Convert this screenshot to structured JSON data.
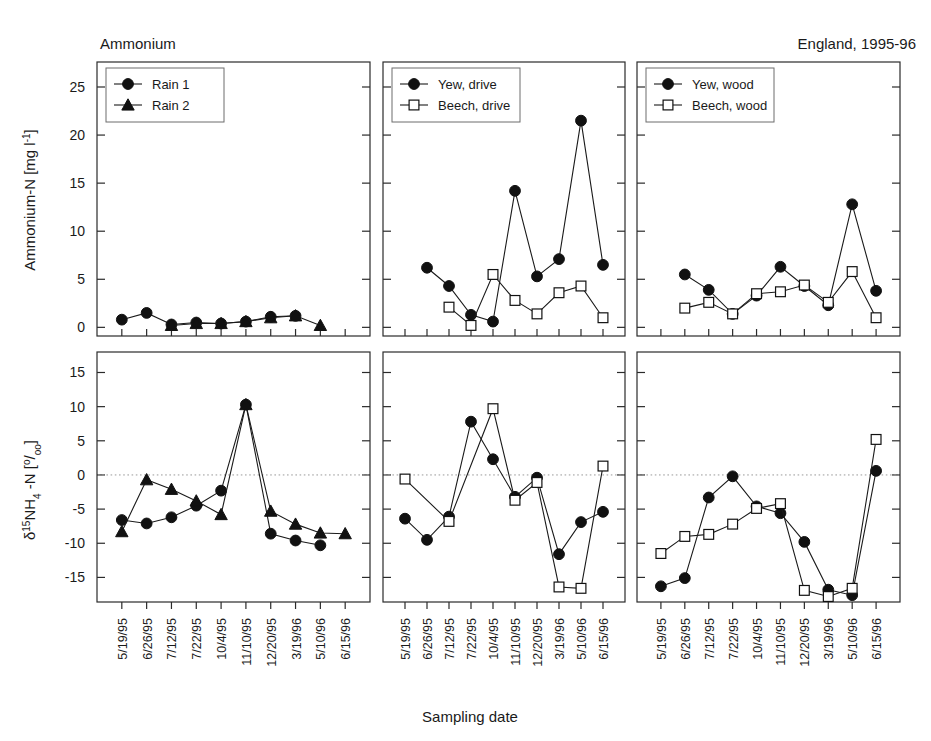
{
  "figure": {
    "title_left": "Ammonium",
    "title_right": "England, 1995-96",
    "xlabel": "Sampling date",
    "ylabel_top": "Ammonium-N [mg l-1]",
    "ylabel_bottom": "d 15NH4-N [o/oo]"
  },
  "axes": {
    "top_ticks": [
      "0",
      "5",
      "10",
      "15",
      "20",
      "25"
    ],
    "bottom_ticks": [
      "-15",
      "-10",
      "-5",
      "0",
      "5",
      "10",
      "15"
    ],
    "top_range": [
      0,
      27
    ],
    "bottom_range": [
      -18,
      17
    ],
    "x_categories": [
      "5/19/95",
      "6/26/95",
      "7/12/95",
      "7/22/95",
      "10/4/95",
      "11/10/95",
      "12/20/95",
      "3/19/96",
      "5/10/96",
      "6/15/96"
    ]
  },
  "legends": {
    "panel1": [
      {
        "label": "Rain 1",
        "marker": "filled-circle"
      },
      {
        "label": "Rain 2",
        "marker": "filled-triangle"
      }
    ],
    "panel2": [
      {
        "label": "Yew, drive",
        "marker": "filled-circle"
      },
      {
        "label": "Beech, drive",
        "marker": "open-square"
      }
    ],
    "panel3": [
      {
        "label": "Yew, wood",
        "marker": "filled-circle"
      },
      {
        "label": "Beech, wood",
        "marker": "open-square"
      }
    ]
  },
  "chart_data": [
    {
      "type": "line",
      "panel": "top-left",
      "title": "Ammonium",
      "xlabel": "Sampling date",
      "ylabel": "Ammonium-N [mg l-1]",
      "ylim": [
        0,
        27
      ],
      "grid": false,
      "legend_position": "top-left",
      "categories": [
        "5/19/95",
        "6/26/95",
        "7/12/95",
        "7/22/95",
        "10/4/95",
        "11/10/95",
        "12/20/95",
        "3/19/96",
        "5/10/96",
        "6/15/96"
      ],
      "series": [
        {
          "name": "Rain 1",
          "marker": "filled-circle",
          "values": [
            0.8,
            1.5,
            0.3,
            0.5,
            0.4,
            0.6,
            1.1,
            1.2,
            null,
            null
          ]
        },
        {
          "name": "Rain 2",
          "marker": "filled-triangle",
          "values": [
            null,
            null,
            0.2,
            0.4,
            0.4,
            0.6,
            1.0,
            1.2,
            0.2,
            null
          ]
        }
      ]
    },
    {
      "type": "line",
      "panel": "top-middle",
      "ylabel": "Ammonium-N [mg l-1]",
      "ylim": [
        0,
        27
      ],
      "grid": false,
      "legend_position": "top-left",
      "categories": [
        "5/19/95",
        "6/26/95",
        "7/12/95",
        "7/22/95",
        "10/4/95",
        "11/10/95",
        "12/20/95",
        "3/19/96",
        "5/10/96",
        "6/15/96"
      ],
      "series": [
        {
          "name": "Yew, drive",
          "marker": "filled-circle",
          "values": [
            null,
            6.2,
            4.3,
            1.3,
            0.6,
            14.2,
            5.3,
            7.1,
            21.5,
            6.5
          ]
        },
        {
          "name": "Beech, drive",
          "marker": "open-square",
          "values": [
            null,
            null,
            2.1,
            0.2,
            5.5,
            2.8,
            1.4,
            3.6,
            4.3,
            1.0
          ]
        }
      ]
    },
    {
      "type": "line",
      "panel": "top-right",
      "ylabel": "Ammonium-N [mg l-1]",
      "ylim": [
        0,
        27
      ],
      "grid": false,
      "legend_position": "top-left",
      "categories": [
        "5/19/95",
        "6/26/95",
        "7/12/95",
        "7/22/95",
        "10/4/95",
        "11/10/95",
        "12/20/95",
        "3/19/96",
        "5/10/96",
        "6/15/96"
      ],
      "series": [
        {
          "name": "Yew, wood",
          "marker": "filled-circle",
          "values": [
            null,
            5.5,
            3.9,
            1.4,
            3.3,
            6.3,
            4.3,
            2.3,
            12.8,
            3.8
          ]
        },
        {
          "name": "Beech, wood",
          "marker": "open-square",
          "values": [
            null,
            2.0,
            2.6,
            1.4,
            3.5,
            3.7,
            4.4,
            2.6,
            5.8,
            1.0
          ]
        }
      ]
    },
    {
      "type": "line",
      "panel": "bottom-left",
      "xlabel": "Sampling date",
      "ylabel": "d 15NH4-N [o/oo]",
      "ylim": [
        -18,
        17
      ],
      "grid": false,
      "zero_line": true,
      "categories": [
        "5/19/95",
        "6/26/95",
        "7/12/95",
        "7/22/95",
        "10/4/95",
        "11/10/95",
        "12/20/95",
        "3/19/96",
        "5/10/96",
        "6/15/96"
      ],
      "series": [
        {
          "name": "Rain 1",
          "marker": "filled-circle",
          "values": [
            -6.6,
            -7.1,
            -6.2,
            -4.5,
            -2.3,
            10.3,
            -8.6,
            -9.6,
            -10.3,
            null
          ]
        },
        {
          "name": "Rain 2",
          "marker": "filled-triangle",
          "values": [
            -8.3,
            -0.7,
            -2.1,
            -3.8,
            -5.8,
            10.3,
            -5.3,
            -7.2,
            -8.5,
            -8.6
          ]
        }
      ]
    },
    {
      "type": "line",
      "panel": "bottom-middle",
      "ylabel": "d 15NH4-N [o/oo]",
      "ylim": [
        -18,
        17
      ],
      "grid": false,
      "zero_line": true,
      "categories": [
        "5/19/95",
        "6/26/95",
        "7/12/95",
        "7/22/95",
        "10/4/95",
        "11/10/95",
        "12/20/95",
        "3/19/96",
        "5/10/96",
        "6/15/96"
      ],
      "series": [
        {
          "name": "Yew, drive",
          "marker": "filled-circle",
          "values": [
            -6.4,
            -9.5,
            -6.1,
            7.8,
            2.3,
            -3.2,
            -0.4,
            -11.6,
            -6.9,
            -5.4
          ]
        },
        {
          "name": "Beech, drive",
          "marker": "open-square",
          "values": [
            -0.6,
            null,
            -6.8,
            null,
            9.7,
            -3.7,
            -1.1,
            -16.4,
            -16.6,
            1.3
          ]
        }
      ]
    },
    {
      "type": "line",
      "panel": "bottom-right",
      "ylabel": "d 15NH4-N [o/oo]",
      "ylim": [
        -18,
        17
      ],
      "grid": false,
      "zero_line": true,
      "categories": [
        "5/19/95",
        "6/26/95",
        "7/12/95",
        "7/22/95",
        "10/4/95",
        "11/10/95",
        "12/20/95",
        "3/19/96",
        "5/10/96",
        "6/15/96"
      ],
      "series": [
        {
          "name": "Yew, wood",
          "marker": "filled-circle",
          "values": [
            -16.3,
            -15.1,
            -3.3,
            -0.2,
            -4.6,
            -5.6,
            -9.8,
            -16.8,
            -17.6,
            0.6
          ]
        },
        {
          "name": "Beech, wood",
          "marker": "open-square",
          "values": [
            -11.5,
            -9.0,
            -8.7,
            -7.2,
            -4.9,
            -4.2,
            -16.9,
            -17.8,
            -16.6,
            5.2
          ]
        }
      ]
    }
  ]
}
